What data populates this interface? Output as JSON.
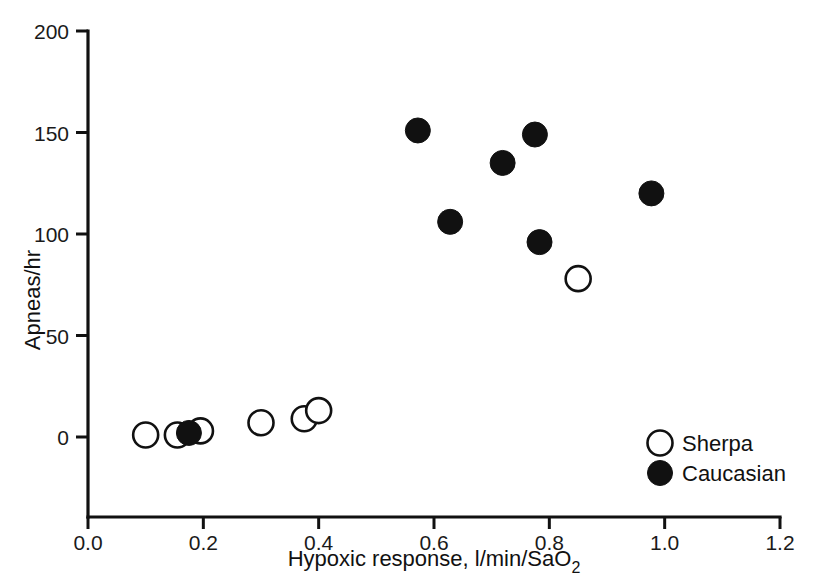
{
  "chart_data": {
    "type": "scatter",
    "title": "",
    "xlabel": "Hypoxic response, l/min/SaO2",
    "xlabel_main": "Hypoxic response, l/min/SaO",
    "xlabel_sub": "2",
    "ylabel": "Apneas/hr",
    "xlim": [
      0.0,
      1.2
    ],
    "ylim": [
      0,
      200
    ],
    "xticks": [
      "0.0",
      "0.2",
      "0.4",
      "0.6",
      "0.8",
      "1.0",
      "1.2"
    ],
    "xtick_values": [
      0.0,
      0.2,
      0.4,
      0.6,
      0.8,
      1.0,
      1.2
    ],
    "yticks": [
      "0",
      "50",
      "100",
      "150",
      "200"
    ],
    "ytick_values": [
      0,
      50,
      100,
      150,
      200
    ],
    "grid": false,
    "legend_position": "bottom-right",
    "series": [
      {
        "name": "Sherpa",
        "marker": "open-circle",
        "color": "#ffffff",
        "edge_color": "#111111",
        "points": [
          {
            "x": 0.1,
            "y": 1
          },
          {
            "x": 0.155,
            "y": 1
          },
          {
            "x": 0.195,
            "y": 3
          },
          {
            "x": 0.3,
            "y": 7
          },
          {
            "x": 0.375,
            "y": 9
          },
          {
            "x": 0.4,
            "y": 13
          },
          {
            "x": 0.85,
            "y": 78
          }
        ]
      },
      {
        "name": "Caucasian",
        "marker": "filled-circle",
        "color": "#111111",
        "edge_color": "#111111",
        "points": [
          {
            "x": 0.175,
            "y": 2
          },
          {
            "x": 0.572,
            "y": 151
          },
          {
            "x": 0.628,
            "y": 106
          },
          {
            "x": 0.719,
            "y": 135
          },
          {
            "x": 0.775,
            "y": 149
          },
          {
            "x": 0.783,
            "y": 96
          },
          {
            "x": 0.977,
            "y": 120
          }
        ]
      }
    ]
  },
  "legend": {
    "entries": [
      {
        "label": "Sherpa",
        "marker": "open-circle"
      },
      {
        "label": "Caucasian",
        "marker": "filled-circle"
      }
    ]
  }
}
